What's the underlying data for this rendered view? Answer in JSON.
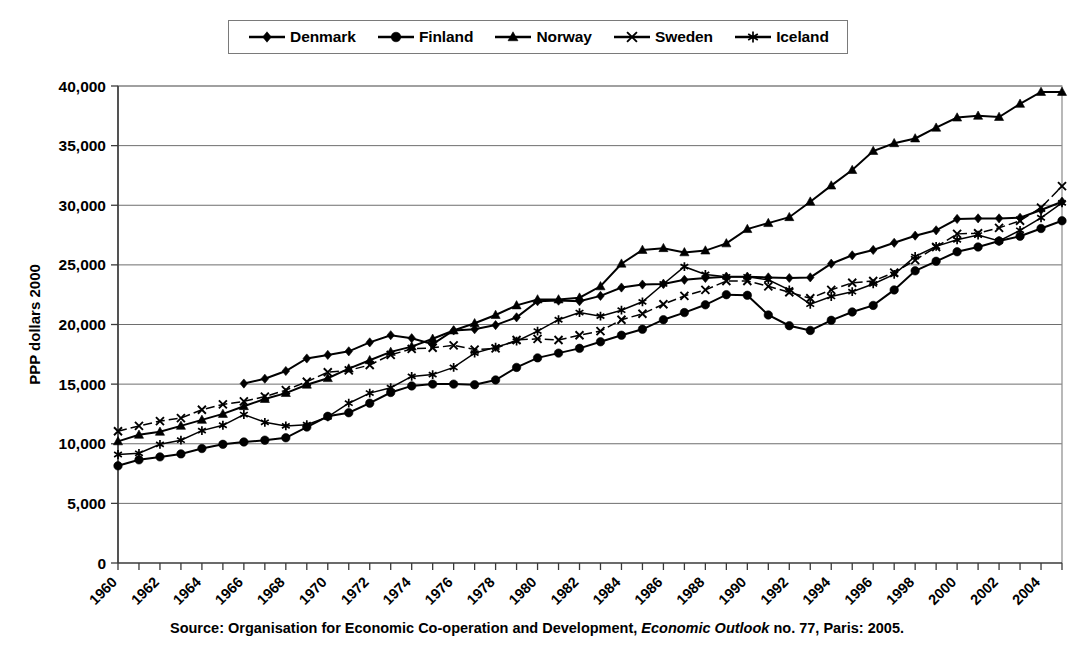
{
  "source_note": {
    "prefix": "Source: Organisation for Economic Co-operation and Development,",
    "italic": "Economic Outlook",
    "suffix": "no. 77, Paris: 2005."
  },
  "legend": {
    "position": "top-center",
    "entries": [
      {
        "label": "Denmark",
        "marker": "diamond",
        "color": "#000000"
      },
      {
        "label": "Finland",
        "marker": "circle",
        "color": "#000000"
      },
      {
        "label": "Norway",
        "marker": "triangle",
        "color": "#000000"
      },
      {
        "label": "Sweden",
        "marker": "x",
        "color": "#000000"
      },
      {
        "label": "Iceland",
        "marker": "asterisk",
        "color": "#000000"
      }
    ]
  },
  "chart_data": {
    "type": "line",
    "title": "",
    "xlabel": "",
    "ylabel": "PPP dollars 2000",
    "ylim": [
      0,
      40000
    ],
    "ytick_values": [
      0,
      5000,
      10000,
      15000,
      20000,
      25000,
      30000,
      35000,
      40000
    ],
    "ytick_labels": [
      "0",
      "5,000",
      "10,000",
      "15,000",
      "20,000",
      "25,000",
      "30,000",
      "35,000",
      "40,000"
    ],
    "grid": true,
    "xlim": [
      1960,
      2005
    ],
    "x": [
      1960,
      1961,
      1962,
      1963,
      1964,
      1965,
      1966,
      1967,
      1968,
      1969,
      1970,
      1971,
      1972,
      1973,
      1974,
      1975,
      1976,
      1977,
      1978,
      1979,
      1980,
      1981,
      1982,
      1983,
      1984,
      1985,
      1986,
      1987,
      1988,
      1989,
      1990,
      1991,
      1992,
      1993,
      1994,
      1995,
      1996,
      1997,
      1998,
      1999,
      2000,
      2001,
      2002,
      2003,
      2004,
      2005
    ],
    "xtick_labels": [
      "1960",
      "1962",
      "1964",
      "1966",
      "1968",
      "1970",
      "1972",
      "1974",
      "1976",
      "1978",
      "1980",
      "1982",
      "1984",
      "1986",
      "1988",
      "1990",
      "1992",
      "1994",
      "1996",
      "1998",
      "2000",
      "2002",
      "2004"
    ],
    "xtick_values": [
      1960,
      1962,
      1964,
      1966,
      1968,
      1970,
      1972,
      1974,
      1976,
      1978,
      1980,
      1982,
      1984,
      1986,
      1988,
      1990,
      1992,
      1994,
      1996,
      1998,
      2000,
      2002,
      2004
    ],
    "xtick_rotation": 45,
    "series": [
      {
        "name": "Denmark",
        "marker": "diamond",
        "start_year": 1966,
        "values": [
          null,
          null,
          null,
          null,
          null,
          null,
          15050,
          15450,
          16100,
          17150,
          17450,
          17750,
          18500,
          19100,
          18850,
          18350,
          19500,
          19600,
          19950,
          20600,
          21950,
          22000,
          21950,
          22400,
          23100,
          23350,
          23400,
          23750,
          23900,
          24000,
          24000,
          23950,
          23900,
          23950,
          25100,
          25800,
          26250,
          26850,
          27450,
          27900,
          28850,
          28900,
          28900,
          28950,
          29600,
          30300
        ]
      },
      {
        "name": "Finland",
        "marker": "circle",
        "start_year": 1960,
        "values": [
          8150,
          8650,
          8900,
          9150,
          9600,
          9950,
          10150,
          10300,
          10500,
          11400,
          12300,
          12600,
          13400,
          14300,
          14850,
          15000,
          15000,
          14950,
          15350,
          16400,
          17200,
          17600,
          18000,
          18550,
          19100,
          19600,
          20400,
          21000,
          21650,
          22500,
          22450,
          20800,
          19900,
          19500,
          20350,
          21050,
          21600,
          22900,
          24500,
          25300,
          26100,
          26500,
          27000,
          27400,
          28050,
          28700
        ]
      },
      {
        "name": "Norway",
        "marker": "triangle",
        "start_year": 1960,
        "values": [
          10200,
          10750,
          11000,
          11500,
          12000,
          12500,
          13150,
          13750,
          14250,
          14950,
          15500,
          16300,
          17000,
          17700,
          18150,
          18800,
          19500,
          20100,
          20800,
          21600,
          22100,
          22100,
          22250,
          23200,
          25100,
          26250,
          26400,
          26050,
          26200,
          26800,
          28000,
          28500,
          29000,
          30300,
          31650,
          32950,
          34550,
          35200,
          35600,
          36500,
          37350,
          37500,
          37400,
          38500,
          39500,
          39500
        ]
      },
      {
        "name": "Sweden",
        "marker": "x",
        "start_year": 1960,
        "values": [
          11050,
          11500,
          11900,
          12150,
          12850,
          13300,
          13550,
          13950,
          14500,
          15200,
          16000,
          16150,
          16600,
          17450,
          17950,
          18050,
          18250,
          17900,
          18000,
          18700,
          18800,
          18700,
          19100,
          19450,
          20400,
          20900,
          21700,
          22400,
          22900,
          23650,
          23650,
          23200,
          22700,
          22200,
          22900,
          23500,
          23650,
          24350,
          25400,
          26500,
          27600,
          27650,
          28100,
          28700,
          29800,
          31600
        ]
      },
      {
        "name": "Iceland",
        "marker": "asterisk",
        "start_year": 1960,
        "values": [
          9100,
          9200,
          9950,
          10300,
          11100,
          11550,
          12450,
          11800,
          11500,
          11600,
          12250,
          13400,
          14250,
          14700,
          15650,
          15800,
          16400,
          17600,
          18100,
          18600,
          19450,
          20400,
          21000,
          20700,
          21200,
          21900,
          23400,
          24850,
          24200,
          24000,
          24000,
          23750,
          22900,
          21700,
          22350,
          22750,
          23400,
          24200,
          25700,
          26550,
          27100,
          27500,
          27000,
          27900,
          28950,
          30200
        ]
      }
    ]
  }
}
